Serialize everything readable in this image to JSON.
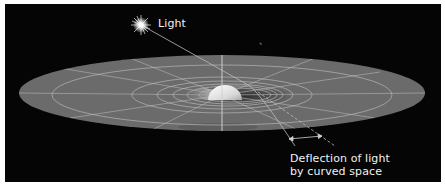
{
  "diagram": {
    "title": "Deflection of light by curved space",
    "labels": {
      "light": "Light",
      "deflection_line1": "Deflection of light",
      "deflection_line2": "by curved space"
    },
    "colors": {
      "background": "#050505",
      "plane": "#6b6b6b",
      "grid_lines": "#b8b8b8",
      "mass_sphere": "#e6e6e6",
      "text": "#f2f2f2"
    },
    "elements": [
      {
        "name": "star",
        "label": "Light",
        "icon": "star-burst-icon"
      },
      {
        "name": "space-plane",
        "shape": "ellipse"
      },
      {
        "name": "massive-body",
        "shape": "hemisphere"
      },
      {
        "name": "light-ray",
        "shape": "line"
      },
      {
        "name": "deflection-indicator",
        "shape": "double-arrow"
      }
    ]
  }
}
